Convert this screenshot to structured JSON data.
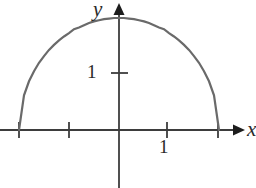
{
  "figure": {
    "background_color": "#ffffff",
    "width": 256,
    "height": 188
  },
  "axes": {
    "x_axis_label": "x",
    "y_axis_label": "y",
    "axis_color": "#3d3d3d",
    "arrowheads": [
      "x-positive",
      "y-positive"
    ],
    "origin": {
      "x": 119,
      "y": 130
    },
    "x_tick_labels": [
      "1"
    ],
    "y_tick_labels": [
      "1"
    ],
    "x_ticks_values": [
      -2,
      -1,
      1,
      2
    ],
    "y_ticks_values": [
      1
    ],
    "x_unit_pixels": 50,
    "y_unit_pixels": 56
  },
  "chart_data": {
    "type": "line",
    "title": "",
    "subtitle": "",
    "xlabel": "x",
    "ylabel": "y",
    "xlim": [
      -2.4,
      2.4
    ],
    "ylim": [
      -0.3,
      2.3
    ],
    "grid": false,
    "legend": null,
    "legend_position": "none",
    "curve_color": "#6a6a6a",
    "curve_width": 2.2,
    "annotations": [],
    "series": [
      {
        "name": "upper semicircle x^2 + y^2 = 4, y >= 0",
        "equation": "y = sqrt(4 - x^2)",
        "center": [
          0,
          0
        ],
        "radius": 2,
        "x": [
          -2,
          -1.9,
          -1.8,
          -1.7,
          -1.6,
          -1.5,
          -1.4,
          -1.3,
          -1.2,
          -1.1,
          -1,
          -0.9,
          -0.8,
          -0.7,
          -0.6,
          -0.5,
          -0.4,
          -0.3,
          -0.2,
          -0.1,
          0,
          0.1,
          0.2,
          0.3,
          0.4,
          0.5,
          0.6,
          0.7,
          0.8,
          0.9,
          1,
          1.1,
          1.2,
          1.3,
          1.4,
          1.5,
          1.6,
          1.7,
          1.8,
          1.9,
          2
        ],
        "values": [
          0,
          0.62,
          0.87,
          1.05,
          1.2,
          1.32,
          1.43,
          1.52,
          1.6,
          1.67,
          1.73,
          1.8,
          1.83,
          1.87,
          1.91,
          1.94,
          1.96,
          1.98,
          1.99,
          2,
          2,
          2,
          1.99,
          1.98,
          1.96,
          1.94,
          1.91,
          1.87,
          1.83,
          1.8,
          1.73,
          1.67,
          1.6,
          1.52,
          1.43,
          1.32,
          1.2,
          1.05,
          0.87,
          0.62,
          0
        ]
      }
    ],
    "x_tick_positions": [
      -2,
      -1,
      1,
      2
    ],
    "x_tick_text": [
      "",
      "",
      "1",
      ""
    ],
    "y_tick_positions": [
      1
    ],
    "y_tick_text": [
      "1"
    ]
  }
}
